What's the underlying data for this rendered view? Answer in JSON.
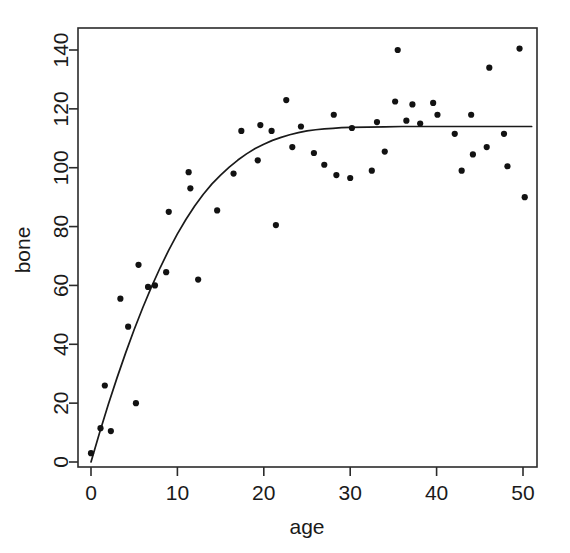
{
  "chart_data": {
    "type": "scatter",
    "title": "",
    "xlabel": "age",
    "ylabel": "bone",
    "xlim": [
      -1.5,
      52
    ],
    "ylim": [
      -5.5,
      145
    ],
    "xticks": [
      0,
      10,
      20,
      30,
      40,
      50
    ],
    "yticks": [
      0,
      20,
      40,
      60,
      80,
      100,
      120,
      140
    ],
    "xticklabels": [
      "0",
      "10",
      "20",
      "30",
      "40",
      "50"
    ],
    "yticklabels": [
      "0",
      "20",
      "40",
      "60",
      "80",
      "100",
      "120",
      "140"
    ],
    "grid": false,
    "legend": null,
    "frame": "box",
    "series": [
      {
        "name": "bone density observations",
        "type": "scatter",
        "marker": "filled-circle",
        "color": "#121212",
        "points": [
          [
            0.0,
            3.0
          ],
          [
            1.1,
            11.5
          ],
          [
            1.6,
            26.0
          ],
          [
            2.3,
            10.5
          ],
          [
            3.4,
            55.5
          ],
          [
            4.3,
            46.0
          ],
          [
            5.2,
            20.0
          ],
          [
            5.5,
            67.0
          ],
          [
            6.6,
            59.5
          ],
          [
            7.4,
            60.0
          ],
          [
            8.7,
            64.5
          ],
          [
            9.0,
            85.0
          ],
          [
            11.3,
            98.5
          ],
          [
            11.5,
            93.0
          ],
          [
            12.4,
            62.0
          ],
          [
            14.6,
            85.5
          ],
          [
            16.5,
            98.0
          ],
          [
            17.4,
            112.5
          ],
          [
            19.3,
            102.5
          ],
          [
            19.6,
            114.5
          ],
          [
            20.9,
            112.5
          ],
          [
            21.4,
            80.5
          ],
          [
            22.6,
            123.0
          ],
          [
            23.3,
            107.0
          ],
          [
            24.3,
            114.0
          ],
          [
            25.8,
            105.0
          ],
          [
            27.0,
            101.0
          ],
          [
            28.1,
            118.0
          ],
          [
            28.4,
            97.5
          ],
          [
            30.0,
            96.5
          ],
          [
            30.2,
            113.5
          ],
          [
            32.5,
            99.0
          ],
          [
            33.1,
            115.5
          ],
          [
            34.0,
            105.5
          ],
          [
            35.2,
            122.5
          ],
          [
            35.5,
            140.0
          ],
          [
            36.5,
            116.0
          ],
          [
            37.2,
            121.5
          ],
          [
            38.1,
            115.0
          ],
          [
            39.6,
            122.0
          ],
          [
            40.1,
            118.0
          ],
          [
            42.1,
            111.5
          ],
          [
            42.9,
            99.0
          ],
          [
            44.0,
            118.0
          ],
          [
            44.2,
            104.5
          ],
          [
            45.8,
            107.0
          ],
          [
            46.1,
            134.0
          ],
          [
            47.8,
            111.5
          ],
          [
            48.2,
            100.5
          ],
          [
            49.6,
            140.5
          ],
          [
            50.2,
            90.0
          ]
        ]
      },
      {
        "name": "fitted curve",
        "type": "line",
        "color": "#1a1a1a",
        "points": [
          [
            0.0,
            0.0
          ],
          [
            1.0,
            10.0
          ],
          [
            2.0,
            19.5
          ],
          [
            3.0,
            28.5
          ],
          [
            4.0,
            37.0
          ],
          [
            5.0,
            45.0
          ],
          [
            6.0,
            52.5
          ],
          [
            7.0,
            59.5
          ],
          [
            8.0,
            66.0
          ],
          [
            9.0,
            72.0
          ],
          [
            10.0,
            77.5
          ],
          [
            11.0,
            82.5
          ],
          [
            12.0,
            87.0
          ],
          [
            13.0,
            91.0
          ],
          [
            14.0,
            94.5
          ],
          [
            15.0,
            97.5
          ],
          [
            16.0,
            100.2
          ],
          [
            17.0,
            102.6
          ],
          [
            18.0,
            104.7
          ],
          [
            19.0,
            106.5
          ],
          [
            20.0,
            108.0
          ],
          [
            21.0,
            109.3
          ],
          [
            22.0,
            110.3
          ],
          [
            23.0,
            111.2
          ],
          [
            24.0,
            111.9
          ],
          [
            25.0,
            112.5
          ],
          [
            26.0,
            112.9
          ],
          [
            27.0,
            113.2
          ],
          [
            28.0,
            113.4
          ],
          [
            29.0,
            113.6
          ],
          [
            30.0,
            113.7
          ],
          [
            32.0,
            113.8
          ],
          [
            34.0,
            113.9
          ],
          [
            36.0,
            114.0
          ],
          [
            38.0,
            114.0
          ],
          [
            40.0,
            114.0
          ],
          [
            44.0,
            114.0
          ],
          [
            48.0,
            114.0
          ],
          [
            51.0,
            114.0
          ]
        ]
      }
    ]
  },
  "axes": {
    "x_title": "age",
    "y_title": "bone"
  },
  "style": {
    "point_color": "#121212",
    "curve_color": "#1a1a1a",
    "frame_color": "#2b2b2b",
    "background": "#ffffff",
    "point_radius": 3.1
  }
}
